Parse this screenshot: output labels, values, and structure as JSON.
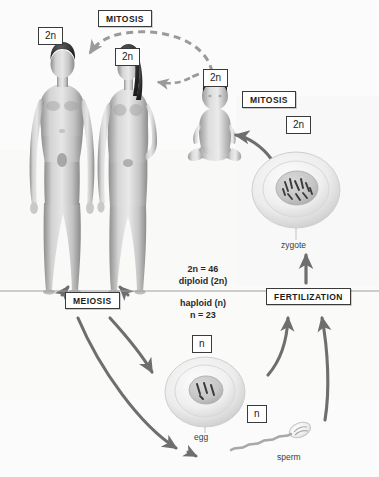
{
  "diagram": {
    "background_color": "#fcfcfc",
    "label_border_color": "#3a3a3a",
    "arrow_color": "#6e6e6e"
  },
  "phase_labels": {
    "mitosis_top": "MITOSIS",
    "mitosis_right": "MITOSIS",
    "meiosis": "MEIOSIS",
    "fertilization": "FERTILIZATION"
  },
  "ploidy_labels": {
    "male_adult": "2n",
    "female_adult": "2n",
    "child": "2n",
    "zygote": "2n",
    "egg": "n",
    "sperm": "n"
  },
  "chromosome_text": {
    "diploid_count": "2n = 46",
    "diploid_name": "diploid (2n)",
    "haploid_name": "haploid (n)",
    "haploid_count": "n = 23"
  },
  "cell_labels": {
    "zygote": "zygote",
    "egg": "egg",
    "sperm": "sperm"
  },
  "organisms": [
    {
      "name": "adult-male",
      "ploidy": "2n"
    },
    {
      "name": "adult-female",
      "ploidy": "2n"
    },
    {
      "name": "child",
      "ploidy": "2n"
    }
  ],
  "cells": [
    {
      "name": "zygote",
      "ploidy": "2n",
      "label": "zygote"
    },
    {
      "name": "egg",
      "ploidy": "n",
      "label": "egg"
    },
    {
      "name": "sperm",
      "ploidy": "n",
      "label": "sperm"
    }
  ]
}
